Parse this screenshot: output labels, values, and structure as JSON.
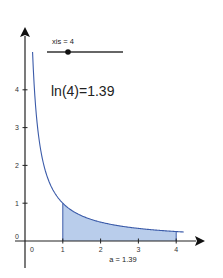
{
  "chart_data": {
    "type": "area",
    "title": "",
    "function": "f(x) = 1/x",
    "xlabel": "",
    "ylabel": "",
    "xlim": [
      -0.2,
      4.6
    ],
    "ylim": [
      -1.0,
      5.6
    ],
    "x_ticks": [
      "0",
      "1",
      "2",
      "3",
      "4"
    ],
    "y_ticks": [
      "0",
      "1",
      "2",
      "3",
      "4"
    ],
    "grid": false,
    "series": [
      {
        "name": "f(x) = 1/x",
        "color": "#3b5ba9",
        "x": [
          0.2,
          0.25,
          0.3,
          0.4,
          0.5,
          0.75,
          1,
          1.5,
          2,
          2.5,
          3,
          3.5,
          4,
          4.2
        ],
        "values": [
          5.0,
          4.0,
          3.33,
          2.5,
          2.0,
          1.33,
          1.0,
          0.67,
          0.5,
          0.4,
          0.33,
          0.29,
          0.25,
          0.24
        ]
      }
    ],
    "shaded_region": {
      "from": 1,
      "to": 4,
      "color": "#b9cdeb",
      "area": 1.39
    },
    "annotations": [
      {
        "text": "xis = 4",
        "role": "slider-label"
      },
      {
        "text": "ln(4)=1.39",
        "role": "result"
      },
      {
        "text": "a = 1.39",
        "role": "area-label"
      }
    ]
  },
  "slider": {
    "label": "xis = 4",
    "value": 4,
    "min": 1,
    "max": 10
  },
  "result_text": "ln(4)=1.39",
  "area_label": "a = 1.39",
  "colors": {
    "curve": "#3b5ba9",
    "fill": "#b9cdeb",
    "axis": "#222222"
  }
}
